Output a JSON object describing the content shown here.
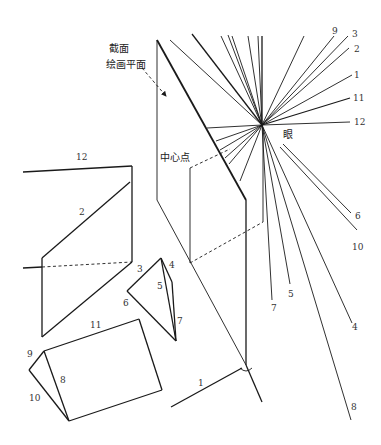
{
  "labels": {
    "cut_plane": "截面",
    "picture_plane": "绘画平面",
    "center_point": "中心点",
    "eye": "眼"
  },
  "ray_labels": {
    "r9": "9",
    "r3": "3",
    "r2": "2",
    "r1": "1",
    "r11": "11",
    "r12": "12",
    "r6": "6",
    "r10": "10",
    "r7": "7",
    "r5": "5",
    "r4": "4",
    "r8": "8"
  },
  "edge_labels": {
    "e12": "12",
    "e2": "2",
    "e3": "3",
    "e4": "4",
    "e5": "5",
    "e6": "6",
    "e7": "7",
    "e11": "11",
    "e9": "9",
    "e8": "8",
    "e10": "10",
    "e1": "1"
  },
  "colors": {
    "line": "#1a1a1a",
    "background": "#ffffff"
  }
}
